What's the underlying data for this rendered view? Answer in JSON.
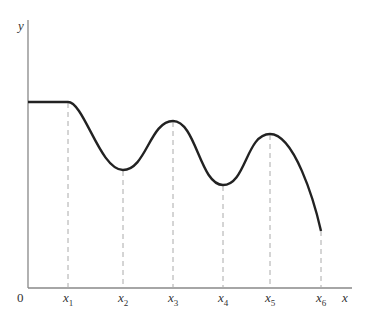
{
  "diagram": {
    "y_axis_label": "y",
    "x_axis_label": "x",
    "origin_label": "0",
    "ticks": [
      {
        "base": "x",
        "sub": "1"
      },
      {
        "base": "x",
        "sub": "2"
      },
      {
        "base": "x",
        "sub": "3"
      },
      {
        "base": "x",
        "sub": "4"
      },
      {
        "base": "x",
        "sub": "5"
      },
      {
        "base": "x",
        "sub": "6"
      }
    ],
    "colors": {
      "curve": "#222222",
      "axis": "#888888",
      "dashed": "#aaaaaa"
    }
  }
}
